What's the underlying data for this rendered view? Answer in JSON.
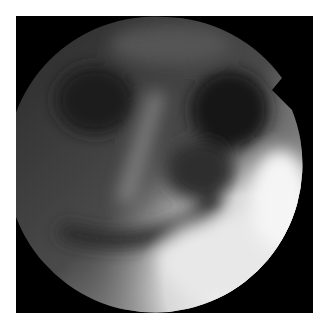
{
  "image": {
    "kind": "endoscopic-view",
    "grayscale": true,
    "background": "#ffffff",
    "frame_color": "#000000",
    "field_of_view": "circular"
  }
}
